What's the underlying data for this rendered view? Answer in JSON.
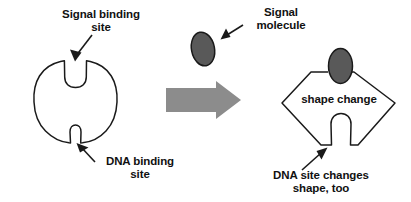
{
  "diagram": {
    "colors": {
      "outline": "#1a1a1a",
      "molecule_fill": "#595959",
      "arrow_fill": "#8c8c8c",
      "background": "#ffffff",
      "text": "#111111"
    },
    "labels": {
      "signal_binding_site": "Signal binding\nsite",
      "dna_binding_site": "DNA binding\nsite",
      "signal_molecule": "Signal\nmolecule",
      "shape_change": "shape change",
      "dna_site_changes": "DNA site changes\nshape, too"
    },
    "shapes": {
      "left_protein": {
        "name": "receptor-protein-unbound",
        "form": "circle-with-two-notches",
        "top_notch": "signal binding site",
        "bottom_notch": "DNA binding site"
      },
      "signal_molecule": {
        "name": "signal-molecule-ellipse",
        "form": "ellipse",
        "state": "free"
      },
      "transition_arrow": {
        "name": "transition-arrow",
        "form": "block-arrow",
        "direction": "right"
      },
      "right_protein": {
        "name": "receptor-protein-bound",
        "form": "diamond-with-bound-ligand",
        "top_notch": "occupied by signal molecule",
        "bottom_notch": "inverted bump"
      }
    },
    "annotations": [
      {
        "name": "arrow-to-signal-binding-site",
        "points_to": "top notch of left protein"
      },
      {
        "name": "arrow-to-dna-binding-site",
        "points_to": "bottom notch of left protein"
      },
      {
        "name": "arrow-to-signal-molecule",
        "points_to": "free signal molecule ellipse"
      },
      {
        "name": "arrow-to-dna-site-changed",
        "points_to": "bottom bump of right protein"
      }
    ]
  }
}
